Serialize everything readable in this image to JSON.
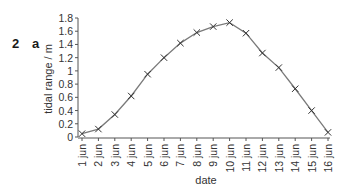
{
  "figure": {
    "question_number": "2",
    "part_label": "a"
  },
  "chart_data": {
    "type": "line",
    "title": "",
    "xlabel": "date",
    "ylabel": "tidal range / m",
    "categories": [
      "1 jun",
      "2 jun",
      "3 jun",
      "4 jun",
      "5 jun",
      "6 jun",
      "7 jun",
      "8 jun",
      "9 jun",
      "10 jun",
      "11 jun",
      "12 jun",
      "13 jun",
      "14 jun",
      "15 jun",
      "16 jun"
    ],
    "series": [
      {
        "name": "tidal range",
        "marker": "x",
        "values": [
          0.05,
          0.12,
          0.34,
          0.62,
          0.95,
          1.2,
          1.42,
          1.58,
          1.67,
          1.73,
          1.57,
          1.27,
          1.05,
          0.73,
          0.4,
          0.07
        ]
      }
    ],
    "ylim": [
      0,
      1.8
    ],
    "yticks": [
      "0",
      "0.2",
      "0.4",
      "0.6",
      "0.8",
      "1",
      "1.2",
      "1.4",
      "1.6",
      "1.8"
    ],
    "grid": false,
    "legend": null,
    "colors": {
      "line": "#7a7a7a",
      "marker": "#333333",
      "axis": "#555555"
    }
  }
}
